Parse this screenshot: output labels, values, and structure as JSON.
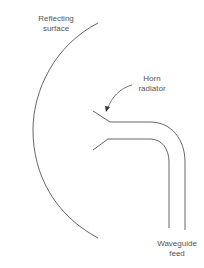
{
  "diagram": {
    "labels": {
      "reflecting_surface": {
        "line1": "Reflecting",
        "line2": "surface"
      },
      "horn_radiator": {
        "line1": "Horn",
        "line2": "radiator"
      },
      "waveguide_feed": {
        "line1": "Waveguide",
        "line2": "feed"
      }
    },
    "colors": {
      "stroke": "#555555",
      "text": "#555555",
      "background": "#ffffff"
    }
  }
}
